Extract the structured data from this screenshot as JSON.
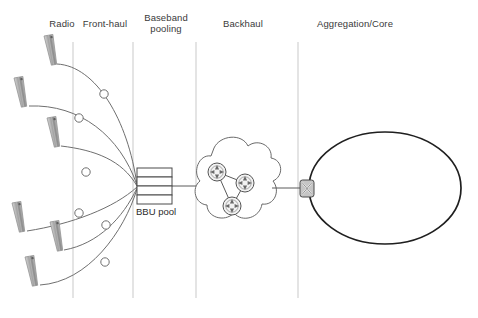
{
  "diagram": {
    "background_color": "#ffffff",
    "line_color": "#6b6b6b",
    "dark_line_color": "#1f1f1f",
    "antenna_color": "#9a9a9a",
    "zones": [
      {
        "id": "radio",
        "label": "Radio",
        "x": 62,
        "y": 18
      },
      {
        "id": "front-haul",
        "label": "Front-haul",
        "x": 105,
        "y": 18
      },
      {
        "id": "baseband-pooling",
        "label": "Baseband\npooling",
        "x": 165,
        "y": 12
      },
      {
        "id": "backhaul",
        "label": "Backhaul",
        "x": 243,
        "y": 18
      },
      {
        "id": "aggregation-core",
        "label": "Aggregation/Core",
        "x": 355,
        "y": 18
      }
    ],
    "separators": [
      {
        "x": 73,
        "y1": 42,
        "y2": 298
      },
      {
        "x": 133,
        "y1": 42,
        "y2": 298
      },
      {
        "x": 196,
        "y1": 42,
        "y2": 298
      },
      {
        "x": 298,
        "y1": 42,
        "y2": 298
      }
    ],
    "antennas": [
      {
        "id": "antenna-1",
        "x": 44,
        "y": 36,
        "rotate": -10
      },
      {
        "id": "antenna-2",
        "x": 14,
        "y": 78,
        "rotate": -10
      },
      {
        "id": "antenna-3",
        "x": 47,
        "y": 118,
        "rotate": -10
      },
      {
        "id": "antenna-4",
        "x": 12,
        "y": 203,
        "rotate": -10
      },
      {
        "id": "antenna-5",
        "x": 50,
        "y": 222,
        "rotate": -10
      },
      {
        "id": "antenna-6",
        "x": 25,
        "y": 257,
        "rotate": -10
      }
    ],
    "fiber_nodes": [
      {
        "id": "fiber-node-1",
        "cx": 104,
        "cy": 94
      },
      {
        "id": "fiber-node-2",
        "cx": 79,
        "cy": 118
      },
      {
        "id": "fiber-node-3",
        "cx": 86,
        "cy": 172
      },
      {
        "id": "fiber-node-4",
        "cx": 79,
        "cy": 213
      },
      {
        "id": "fiber-node-5",
        "cx": 106,
        "cy": 225
      },
      {
        "id": "fiber-node-6",
        "cx": 105,
        "cy": 262
      }
    ],
    "bbu_pool": {
      "label": "BBU pool",
      "label_x": 136,
      "label_y": 206,
      "x": 137,
      "y": 168,
      "width": 35,
      "height": 36,
      "layers": 4
    },
    "cloud": {
      "id": "backhaul-cloud",
      "cx": 238,
      "cy": 184
    },
    "routers": [
      {
        "id": "router-1",
        "cx": 217,
        "cy": 172,
        "r": 9
      },
      {
        "id": "router-2",
        "cx": 245,
        "cy": 183,
        "r": 9
      },
      {
        "id": "router-3",
        "cx": 232,
        "cy": 206,
        "r": 9
      }
    ],
    "switch": {
      "id": "aggregation-switch",
      "x": 300,
      "y": 180,
      "width": 14,
      "height": 17
    },
    "core_ring": {
      "id": "core-ring-ellipse",
      "cx": 385,
      "cy": 188,
      "rx": 76,
      "ry": 56
    },
    "links": [
      {
        "id": "bbu-to-cloud",
        "x1": 172,
        "y1": 186,
        "x2": 205,
        "y2": 186
      },
      {
        "id": "cloud-to-switch",
        "x1": 272,
        "y1": 188,
        "x2": 300,
        "y2": 188
      }
    ]
  }
}
